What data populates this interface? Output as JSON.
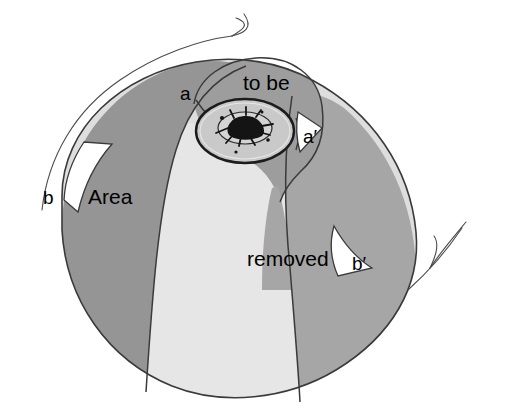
{
  "figure": {
    "type": "medical-illustration",
    "background_color": "#ffffff",
    "outline_color": "#3a3a3a",
    "labels": {
      "a": "a",
      "a_prime": "a′",
      "b": "b",
      "b_prime": "b′",
      "to_be": "to be",
      "area": "Area",
      "removed": "removed"
    },
    "caption_phrase": "Area to be removed",
    "regions": [
      {
        "name": "upper-mound-to-be",
        "fill": "#9d9d9d",
        "label": "to be"
      },
      {
        "name": "left-area-wedge",
        "fill": "#959595",
        "label": "Area"
      },
      {
        "name": "central-light-wedge",
        "fill": "#e3e3e3",
        "label": ""
      },
      {
        "name": "right-removed-region",
        "fill": "#a6a6a6",
        "label": "removed"
      },
      {
        "name": "lower-light-region",
        "fill": "#dedede",
        "label": ""
      },
      {
        "name": "areola-disc",
        "fill": "#c9c9c9",
        "label": ""
      },
      {
        "name": "nipple-core",
        "fill": "#141414",
        "label": ""
      }
    ],
    "fills": {
      "dark_gray": "#959595",
      "mid_gray": "#a6a6a6",
      "mound_gray": "#9d9d9d",
      "light_gray": "#e3e3e3",
      "pale_gray": "#dedede",
      "areola_gray": "#c9c9c9",
      "nipple_black": "#141414"
    },
    "marker_lines": [
      {
        "name": "upper-left-hair-line",
        "description": "thin forked curve at upper area"
      },
      {
        "name": "lower-right-hair-line",
        "description": "thin forked curve at lower right"
      }
    ]
  }
}
